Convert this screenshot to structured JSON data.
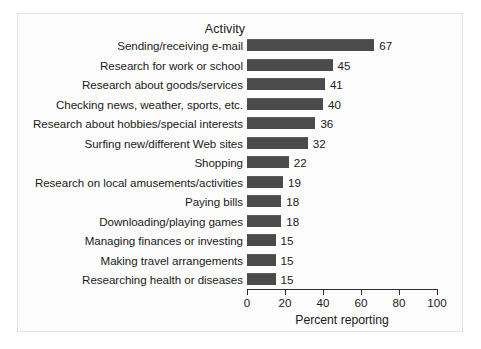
{
  "chart_data": {
    "type": "bar",
    "orientation": "horizontal",
    "title": "Activity",
    "xlabel": "Percent reporting",
    "ylabel": "",
    "xlim": [
      0,
      100
    ],
    "xticks": [
      0,
      20,
      40,
      60,
      80,
      100
    ],
    "grid": false,
    "legend": null,
    "bar_color": "#4b4b4b",
    "categories": [
      "Sending/receiving e-mail",
      "Research for work or school",
      "Research about goods/services",
      "Checking news, weather, sports, etc.",
      "Research about hobbies/special interests",
      "Surfing new/different Web sites",
      "Shopping",
      "Research on local amusements/activities",
      "Paying bills",
      "Downloading/playing games",
      "Managing finances or investing",
      "Making travel arrangements",
      "Researching health or diseases"
    ],
    "values": [
      67,
      45,
      41,
      40,
      36,
      32,
      22,
      19,
      18,
      18,
      15,
      15,
      15
    ],
    "value_labels": [
      "67",
      "45",
      "41",
      "40",
      "36",
      "32",
      "22",
      "19",
      "18",
      "18",
      "15",
      "15",
      "15"
    ],
    "tick_labels": [
      "0",
      "20",
      "40",
      "60",
      "80",
      "100"
    ]
  }
}
